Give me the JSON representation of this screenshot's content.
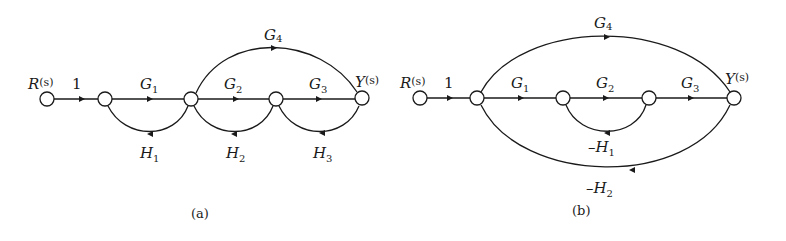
{
  "diagram": {
    "type": "signal-flow-graph",
    "panels": [
      {
        "caption": "(a)",
        "input_label": {
          "main": "R",
          "arg": "(s)"
        },
        "output_label": {
          "main": "Y",
          "arg": "(s)"
        },
        "input_gain": "1",
        "nodes": 5,
        "forward_branches": [
          {
            "from": 2,
            "to": 3,
            "main": "G",
            "sub": "1"
          },
          {
            "from": 3,
            "to": 4,
            "main": "G",
            "sub": "2"
          },
          {
            "from": 4,
            "to": 5,
            "main": "G",
            "sub": "3"
          },
          {
            "from": 3,
            "to": 5,
            "main": "G",
            "sub": "4"
          }
        ],
        "feedback_branches": [
          {
            "from": 3,
            "to": 2,
            "prefix": "",
            "main": "H",
            "sub": "1"
          },
          {
            "from": 4,
            "to": 3,
            "prefix": "",
            "main": "H",
            "sub": "2"
          },
          {
            "from": 5,
            "to": 4,
            "prefix": "",
            "main": "H",
            "sub": "3"
          }
        ]
      },
      {
        "caption": "(b)",
        "input_label": {
          "main": "R",
          "arg": "(s)"
        },
        "output_label": {
          "main": "Y",
          "arg": "(s)"
        },
        "input_gain": "1",
        "nodes": 5,
        "forward_branches": [
          {
            "from": 2,
            "to": 3,
            "main": "G",
            "sub": "1"
          },
          {
            "from": 3,
            "to": 4,
            "main": "G",
            "sub": "2"
          },
          {
            "from": 4,
            "to": 5,
            "main": "G",
            "sub": "3"
          },
          {
            "from": 2,
            "to": 5,
            "main": "G",
            "sub": "4"
          }
        ],
        "feedback_branches": [
          {
            "from": 4,
            "to": 3,
            "prefix": "–",
            "main": "H",
            "sub": "1"
          },
          {
            "from": 5,
            "to": 2,
            "prefix": "–",
            "main": "H",
            "sub": "2"
          }
        ]
      }
    ]
  }
}
